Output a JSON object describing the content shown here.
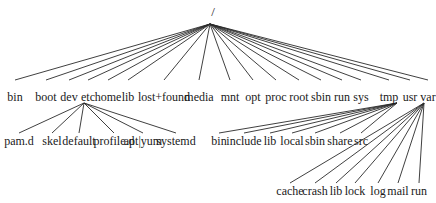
{
  "diagram": {
    "type": "directory-tree",
    "line_color": "#2a2a2a",
    "root": {
      "label": "/",
      "x": 213,
      "y": 6,
      "apex": [
        210,
        24
      ]
    },
    "level1": {
      "line_end_y": 80,
      "label_y": 91,
      "nodes": [
        {
          "label": "bin",
          "x": 15
        },
        {
          "label": "boot",
          "x": 46
        },
        {
          "label": "dev",
          "x": 69
        },
        {
          "label": "etc",
          "x": 88
        },
        {
          "label": "home",
          "x": 108
        },
        {
          "label": "lib",
          "x": 128
        },
        {
          "label": "lost+found",
          "x": 164
        },
        {
          "label": "media",
          "x": 199
        },
        {
          "label": "mnt",
          "x": 230
        },
        {
          "label": "opt",
          "x": 253
        },
        {
          "label": "proc",
          "x": 276
        },
        {
          "label": "root",
          "x": 299
        },
        {
          "label": "sbin",
          "x": 321
        },
        {
          "label": "run",
          "x": 342
        },
        {
          "label": "sys",
          "x": 361
        },
        {
          "label": "tmp",
          "x": 389
        },
        {
          "label": "usr",
          "x": 410
        },
        {
          "label": "var",
          "x": 428
        }
      ]
    },
    "subtrees": [
      {
        "parent": "etc",
        "apex": [
          84,
          103
        ],
        "line_end_y": 133,
        "label_y": 135,
        "children": [
          {
            "label": "pam.d",
            "x": 19
          },
          {
            "label": "skel",
            "x": 52
          },
          {
            "label": "default",
            "x": 79
          },
          {
            "label": "profile.d",
            "x": 114
          },
          {
            "label": "apt|yum",
            "x": 143
          },
          {
            "label": "systemd",
            "x": 176
          }
        ]
      },
      {
        "parent": "usr",
        "apex": [
          397,
          103
        ],
        "line_end_y": 133,
        "label_y": 135,
        "children": [
          {
            "label": "bin",
            "x": 219
          },
          {
            "label": "include",
            "x": 244
          },
          {
            "label": "lib",
            "x": 270
          },
          {
            "label": "local",
            "x": 292
          },
          {
            "label": "sbin",
            "x": 315
          },
          {
            "label": "share",
            "x": 340
          },
          {
            "label": "src",
            "x": 361
          }
        ]
      },
      {
        "parent": "var",
        "apex": [
          424,
          103
        ],
        "line_end_y": 183,
        "label_y": 185,
        "children": [
          {
            "label": "cache",
            "x": 290
          },
          {
            "label": "crash",
            "x": 315
          },
          {
            "label": "lib",
            "x": 336
          },
          {
            "label": "lock",
            "x": 355
          },
          {
            "label": "log",
            "x": 378
          },
          {
            "label": "mail",
            "x": 398
          },
          {
            "label": "run",
            "x": 419
          }
        ]
      }
    ]
  }
}
